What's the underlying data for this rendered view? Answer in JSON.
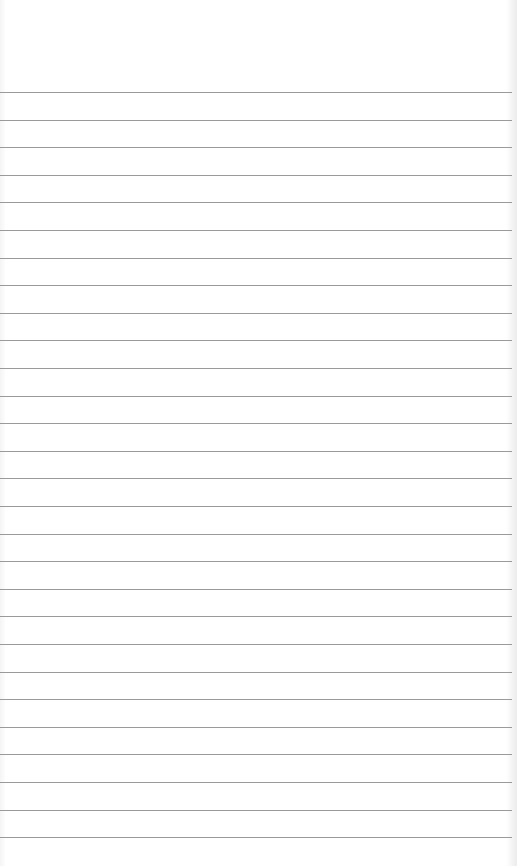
{
  "page": {
    "type": "lined-notepad",
    "background_color": "#ffffff",
    "rule_color": "#9a9a9a",
    "rule_count": 28,
    "first_rule_y": 92,
    "rule_spacing": 27.6,
    "content": ""
  }
}
